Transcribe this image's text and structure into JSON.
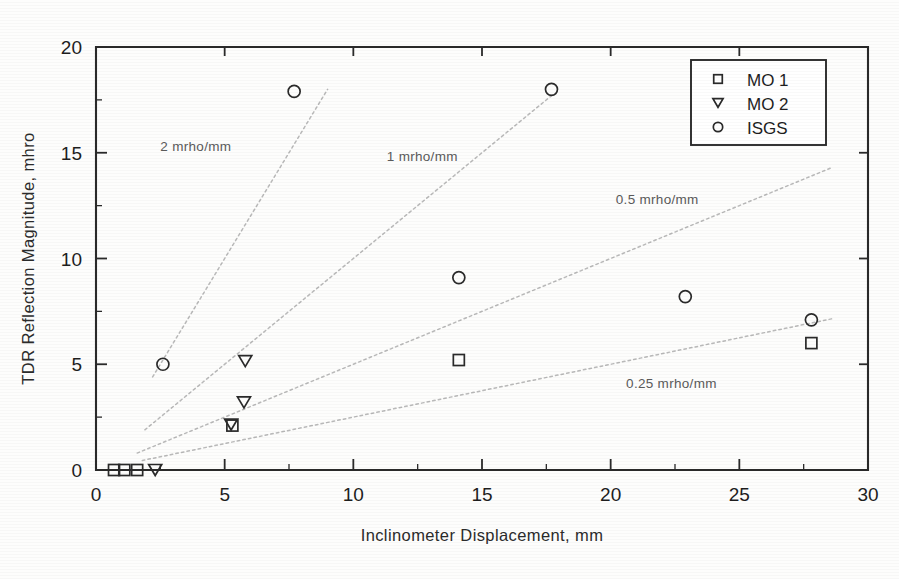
{
  "chart_data": {
    "type": "scatter",
    "title": "",
    "xlabel": "Inclinometer Displacement,  mm",
    "ylabel": "TDR Reflection Magnitude,  mhro",
    "xlim": [
      0,
      30
    ],
    "ylim": [
      0,
      20
    ],
    "xticks": [
      0,
      5,
      10,
      15,
      20,
      25,
      30
    ],
    "yticks": [
      0,
      5,
      10,
      15,
      20
    ],
    "xtick_labels": [
      "0",
      "5",
      "10",
      "15",
      "20",
      "25",
      "30"
    ],
    "ytick_labels": [
      "0",
      "5",
      "10",
      "15",
      "20"
    ],
    "grid": false,
    "legend_position": "top-right",
    "series": [
      {
        "name": "MO 1",
        "marker": "square",
        "points": [
          {
            "x": 0.7,
            "y": 0.0
          },
          {
            "x": 1.1,
            "y": 0.0
          },
          {
            "x": 1.6,
            "y": 0.0
          },
          {
            "x": 5.3,
            "y": 2.1
          },
          {
            "x": 14.1,
            "y": 5.2
          },
          {
            "x": 27.8,
            "y": 6.0
          }
        ]
      },
      {
        "name": "MO 2",
        "marker": "triangle-down",
        "points": [
          {
            "x": 2.3,
            "y": 0.0
          },
          {
            "x": 5.8,
            "y": 5.15
          },
          {
            "x": 5.75,
            "y": 3.2
          },
          {
            "x": 5.25,
            "y": 2.15
          }
        ]
      },
      {
        "name": "ISGS",
        "marker": "circle",
        "points": [
          {
            "x": 2.6,
            "y": 5.0
          },
          {
            "x": 7.7,
            "y": 17.9
          },
          {
            "x": 17.7,
            "y": 18.0
          },
          {
            "x": 14.1,
            "y": 9.1
          },
          {
            "x": 22.9,
            "y": 8.2
          },
          {
            "x": 27.8,
            "y": 7.1
          }
        ]
      }
    ],
    "reference_lines": [
      {
        "label": "2 mrho/mm",
        "slope": 2.0,
        "x_start": 2.2,
        "x_end": 9.0
      },
      {
        "label": "1 mrho/mm",
        "slope": 1.0,
        "x_start": 1.9,
        "x_end": 17.8
      },
      {
        "label": "0.5 mrho/mm",
        "slope": 0.5,
        "x_start": 1.6,
        "x_end": 28.6
      },
      {
        "label": "0.25 mrho/mm",
        "slope": 0.25,
        "x_start": 1.8,
        "x_end": 28.6
      }
    ],
    "annotations": [
      {
        "text": "2 mrho/mm",
        "x": 2.5,
        "y": 15.1
      },
      {
        "text": "1 mrho/mm",
        "x": 11.3,
        "y": 14.6
      },
      {
        "text": "0.5 mrho/mm",
        "x": 20.2,
        "y": 12.6
      },
      {
        "text": "0.25 mrho/mm",
        "x": 20.6,
        "y": 3.9
      }
    ]
  },
  "legend": {
    "entries": [
      {
        "label": "MO 1",
        "marker": "square"
      },
      {
        "label": "MO 2",
        "marker": "triangle-down"
      },
      {
        "label": "ISGS",
        "marker": "circle"
      }
    ]
  },
  "colors": {
    "axis": "#2a2a2a",
    "marker": "#2a2a2a",
    "guideline": "#b9b9b9",
    "annotation": "#5a5a5a",
    "background": "#fdfdfc"
  }
}
